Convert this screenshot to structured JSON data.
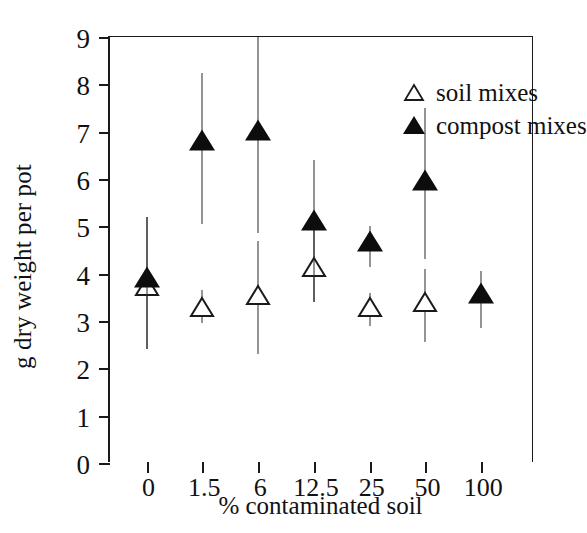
{
  "chart_data": {
    "type": "scatter",
    "title": "",
    "xlabel": "% contaminated soil",
    "ylabel": "g dry weight per pot",
    "categories": [
      "0",
      "1.5",
      "6",
      "12.5",
      "25",
      "50",
      "100"
    ],
    "ylim": [
      0,
      9
    ],
    "yticks": [
      0,
      1,
      2,
      3,
      4,
      5,
      6,
      7,
      8,
      9
    ],
    "grid": false,
    "legend_position": "top-right",
    "error_bars": "vertical, capless",
    "series": [
      {
        "name": "soil mixes",
        "marker": "open-triangle",
        "color": "#0d0d0d",
        "fill": "none",
        "values": [
          3.75,
          3.3,
          3.55,
          4.15,
          3.3,
          3.4,
          null
        ],
        "err_low": [
          2.4,
          2.95,
          2.3,
          3.4,
          2.9,
          2.55,
          null
        ],
        "err_high": [
          5.2,
          3.65,
          4.7,
          4.95,
          3.6,
          4.1,
          null
        ]
      },
      {
        "name": "compost mixes",
        "marker": "filled-triangle",
        "color": "#0d0d0d",
        "fill": "solid",
        "values": [
          3.85,
          6.75,
          6.95,
          5.05,
          4.6,
          5.9,
          3.5
        ],
        "err_low": [
          2.4,
          5.05,
          4.85,
          3.4,
          4.15,
          4.3,
          2.85
        ],
        "err_high": [
          5.2,
          8.25,
          9.2,
          6.4,
          5.0,
          7.5,
          4.05
        ]
      }
    ]
  },
  "legend": {
    "entries": [
      {
        "label": "soil mixes",
        "symbol": "open-triangle-icon"
      },
      {
        "label": "compost mixes",
        "symbol": "filled-triangle-icon"
      }
    ]
  }
}
